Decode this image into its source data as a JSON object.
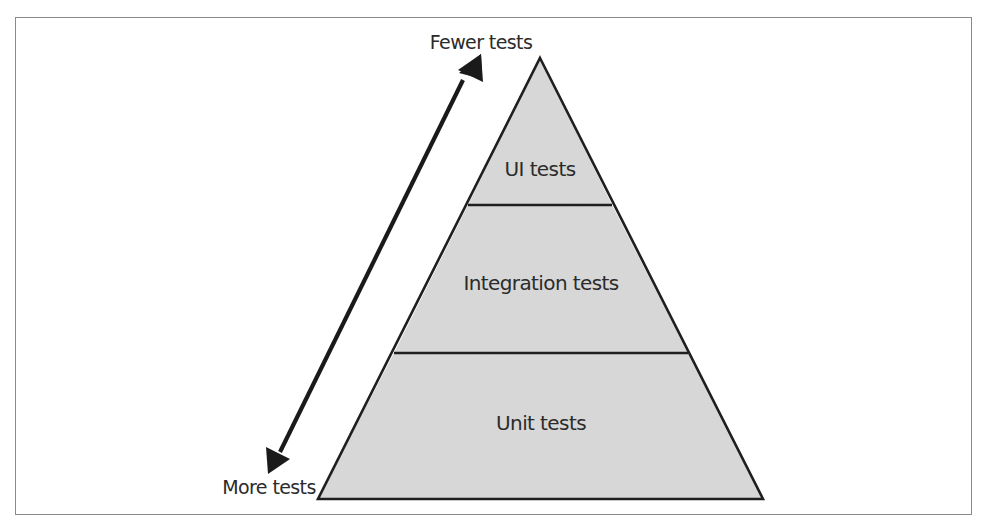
{
  "diagram": {
    "type": "test-pyramid",
    "colors": {
      "tier_fill": "#d9d9d9",
      "outline": "#1f1f1f",
      "arrow": "#1a1a1a",
      "text": "#2b2b2b",
      "frame": "#8a8a8a"
    },
    "tiers": [
      {
        "label": "UI tests",
        "position": "top"
      },
      {
        "label": "Integration tests",
        "position": "middle"
      },
      {
        "label": "Unit tests",
        "position": "bottom"
      }
    ],
    "arrow": {
      "top_label": "Fewer tests",
      "bottom_label": "More tests",
      "direction": "bidirectional"
    }
  }
}
